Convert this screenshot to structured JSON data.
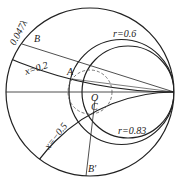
{
  "chart": {
    "type": "smith-chart",
    "labels": {
      "wavelength": "0.047λ",
      "x_pos": "x=0.2",
      "x_neg": "x=−0.5",
      "r1": "r=0.6",
      "r2": "r=0.83",
      "pointA": "A",
      "pointB": "B",
      "pointBprime": "B′",
      "pointO": "O",
      "pointC": "C"
    },
    "colors": {
      "line": "#222222",
      "dashed": "#555555"
    }
  }
}
